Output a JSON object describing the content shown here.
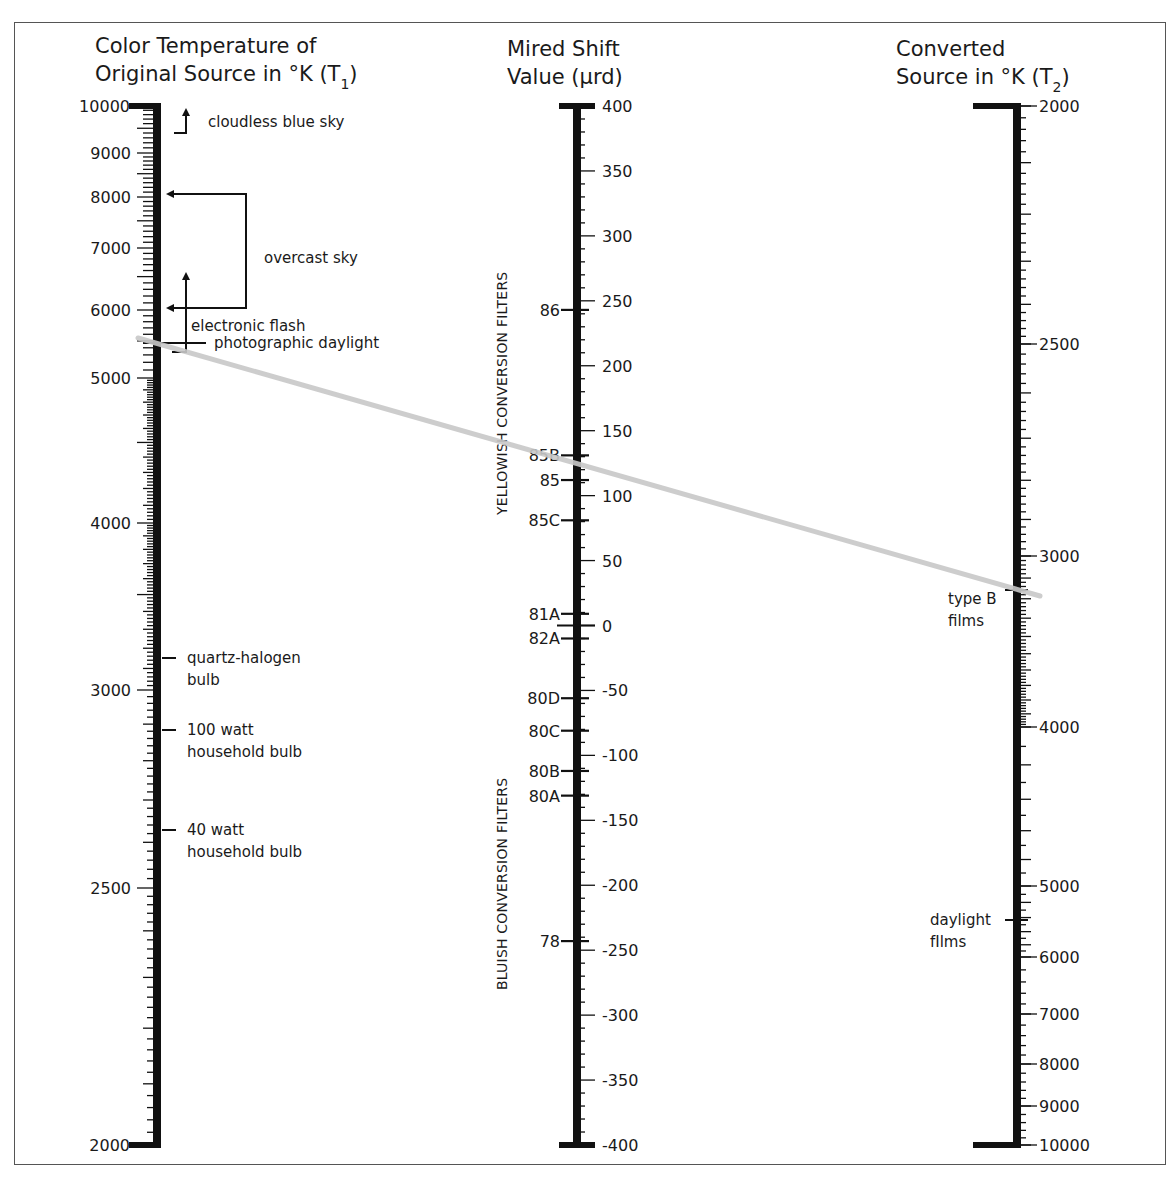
{
  "chart_data": {
    "type": "nomogram",
    "axes": [
      {
        "id": "t1",
        "title_lines": [
          "Color Temperature of",
          "Original Source in °K (T1)"
        ],
        "unit": "K",
        "range": [
          2000,
          10000
        ],
        "tick_labels": [
          {
            "value": 10000,
            "label": "10000",
            "y": 106
          },
          {
            "value": 9000,
            "label": "9000",
            "y": 153
          },
          {
            "value": 8000,
            "label": "8000",
            "y": 197
          },
          {
            "value": 7000,
            "label": "7000",
            "y": 248
          },
          {
            "value": 6000,
            "label": "6000",
            "y": 310
          },
          {
            "value": 5000,
            "label": "5000",
            "y": 378
          },
          {
            "value": 4000,
            "label": "4000",
            "y": 523
          },
          {
            "value": 3000,
            "label": "3000",
            "y": 690
          },
          {
            "value": 2500,
            "label": "2500",
            "y": 888
          },
          {
            "value": 2000,
            "label": "2000",
            "y": 1145
          }
        ],
        "annotations": [
          {
            "label": "cloudless blue sky",
            "y": 121
          },
          {
            "label": "overcast sky",
            "range": [
              6000,
              8000
            ],
            "y": 258
          },
          {
            "label": "electronic flash",
            "y": 325
          },
          {
            "label": "photographic daylight",
            "value": 5500,
            "y": 343
          },
          {
            "label_lines": [
              "quartz-halogen",
              "bulb"
            ],
            "value": 3200,
            "y": 658
          },
          {
            "label_lines": [
              "100 watt",
              "household bulb"
            ],
            "value": 2900,
            "y": 730
          },
          {
            "label_lines": [
              "40 watt",
              "household bulb"
            ],
            "value": 2600,
            "y": 830
          }
        ]
      },
      {
        "id": "mired",
        "title_lines": [
          "Mired Shift",
          "Value (µrd)"
        ],
        "unit": "µrd",
        "range": [
          -400,
          400
        ],
        "tick_labels": [
          {
            "value": 400,
            "label": "400"
          },
          {
            "value": 350,
            "label": "350"
          },
          {
            "value": 300,
            "label": "300"
          },
          {
            "value": 250,
            "label": "250"
          },
          {
            "value": 200,
            "label": "200"
          },
          {
            "value": 150,
            "label": "150"
          },
          {
            "value": 100,
            "label": "100"
          },
          {
            "value": 50,
            "label": "50"
          },
          {
            "value": 0,
            "label": "0"
          },
          {
            "value": -50,
            "label": "-50"
          },
          {
            "value": -100,
            "label": "-100"
          },
          {
            "value": -150,
            "label": "-150"
          },
          {
            "value": -200,
            "label": "-200"
          },
          {
            "value": -250,
            "label": "-250"
          },
          {
            "value": -300,
            "label": "-300"
          },
          {
            "value": -350,
            "label": "-350"
          },
          {
            "value": -400,
            "label": "-400"
          }
        ],
        "filters": [
          {
            "label": "86",
            "value": 243
          },
          {
            "label": "85B",
            "value": 131
          },
          {
            "label": "85",
            "value": 112
          },
          {
            "label": "85C",
            "value": 81
          },
          {
            "label": "81A",
            "value": 9
          },
          {
            "label": "82A",
            "value": -10
          },
          {
            "label": "80D",
            "value": -56
          },
          {
            "label": "80C",
            "value": -81
          },
          {
            "label": "80B",
            "value": -112
          },
          {
            "label": "80A",
            "value": -131
          },
          {
            "label": "78",
            "value": -243
          }
        ],
        "group_labels": [
          {
            "label": "YELLOWISH CONVERSION FILTERS",
            "side": "positive"
          },
          {
            "label": "BLUISH CONVERSION FILTERS",
            "side": "negative"
          }
        ]
      },
      {
        "id": "t2",
        "title_lines": [
          "Converted",
          "Source in °K (T2)"
        ],
        "unit": "K",
        "range": [
          2000,
          10000
        ],
        "tick_labels": [
          {
            "value": 2000,
            "label": "2000",
            "y": 106
          },
          {
            "value": 2500,
            "label": "2500",
            "y": 344
          },
          {
            "value": 3000,
            "label": "3000",
            "y": 556
          },
          {
            "value": 4000,
            "label": "4000",
            "y": 727
          },
          {
            "value": 5000,
            "label": "5000",
            "y": 886
          },
          {
            "value": 6000,
            "label": "6000",
            "y": 957
          },
          {
            "value": 7000,
            "label": "7000",
            "y": 1014
          },
          {
            "value": 8000,
            "label": "8000",
            "y": 1064
          },
          {
            "value": 9000,
            "label": "9000",
            "y": 1106
          },
          {
            "value": 10000,
            "label": "10000",
            "y": 1145
          }
        ],
        "annotations": [
          {
            "label_lines": [
              "type B",
              "films"
            ],
            "value": 3200,
            "y": 590
          },
          {
            "label_lines": [
              "daylight",
              "fIlms"
            ],
            "value": 5500,
            "y": 920
          }
        ]
      }
    ],
    "example_line": {
      "from": {
        "axis": "t1",
        "value": 5500
      },
      "through": {
        "axis": "mired",
        "value": 131,
        "label": "85B"
      },
      "to": {
        "axis": "t2",
        "value": 3200
      },
      "color": "#c8c8c8"
    }
  },
  "colors": {
    "axis": "#111111",
    "text": "#1a1a1a",
    "frame": "#555555",
    "example_line": "#c8c8c8"
  }
}
